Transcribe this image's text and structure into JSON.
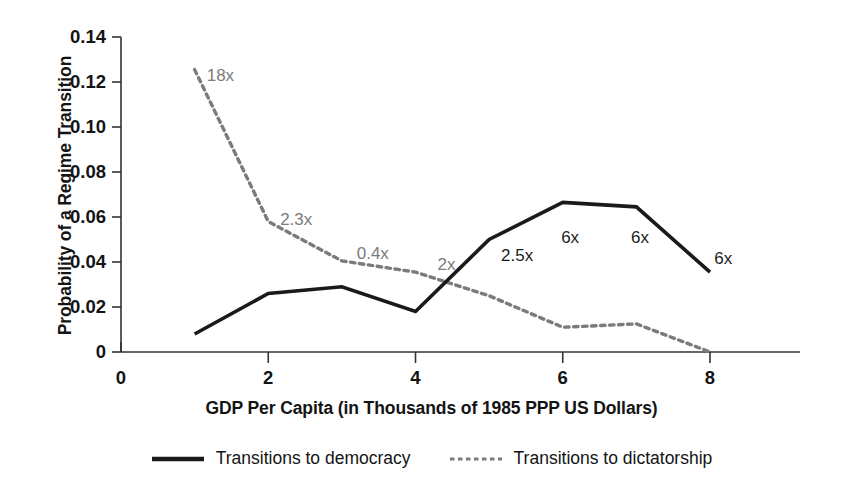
{
  "chart_data": {
    "type": "line",
    "title": "",
    "xlabel": "GDP Per Capita (in Thousands of 1985 PPP US Dollars)",
    "ylabel": "Probability of a Regime Transition",
    "xlim": [
      0,
      8.6
    ],
    "ylim": [
      0,
      0.14
    ],
    "grid": false,
    "legend_position": "bottom",
    "x": [
      1,
      2,
      3,
      4,
      5,
      6,
      7,
      8
    ],
    "xticks": [
      "0",
      "2",
      "4",
      "6",
      "8"
    ],
    "xtick_values": [
      0,
      2,
      4,
      6,
      8
    ],
    "yticks": [
      "0",
      "0.02",
      "0.04",
      "0.06",
      "0.08",
      "0.10",
      "0.12",
      "0.14"
    ],
    "ytick_values": [
      0,
      0.02,
      0.04,
      0.06,
      0.08,
      0.1,
      0.12,
      0.14
    ],
    "series": [
      {
        "name": "Transitions to democracy",
        "style": "solid",
        "color": "#1a1a1a",
        "values": [
          0.008,
          0.026,
          0.029,
          0.018,
          0.05,
          0.0665,
          0.0645,
          0.0355
        ]
      },
      {
        "name": "Transitions to dictatorship",
        "style": "dashed",
        "color": "#7b7b7b",
        "values": [
          0.1255,
          0.058,
          0.0405,
          0.0355,
          0.025,
          0.011,
          0.0125,
          0.0
        ]
      }
    ],
    "annotations": [
      {
        "text": "18x",
        "x": 1.35,
        "y": 0.1225,
        "color": "#7b7b7b"
      },
      {
        "text": "2.3x",
        "x": 2.38,
        "y": 0.0585,
        "color": "#7b7b7b"
      },
      {
        "text": "0.4x",
        "x": 3.42,
        "y": 0.0435,
        "color": "#7b7b7b"
      },
      {
        "text": "2x",
        "x": 4.42,
        "y": 0.0385,
        "color": "#7b7b7b"
      },
      {
        "text": "2.5x",
        "x": 5.38,
        "y": 0.0425,
        "color": "#1d1d1d"
      },
      {
        "text": "6x",
        "x": 6.1,
        "y": 0.0505,
        "color": "#1d1d1d"
      },
      {
        "text": "6x",
        "x": 7.05,
        "y": 0.0505,
        "color": "#1d1d1d"
      },
      {
        "text": "6x",
        "x": 8.18,
        "y": 0.0415,
        "color": "#1d1d1d"
      }
    ]
  },
  "legend": {
    "items": [
      {
        "label": "Transitions to democracy",
        "style": "solid"
      },
      {
        "label": "Transitions to dictatorship",
        "style": "dashed"
      }
    ]
  }
}
